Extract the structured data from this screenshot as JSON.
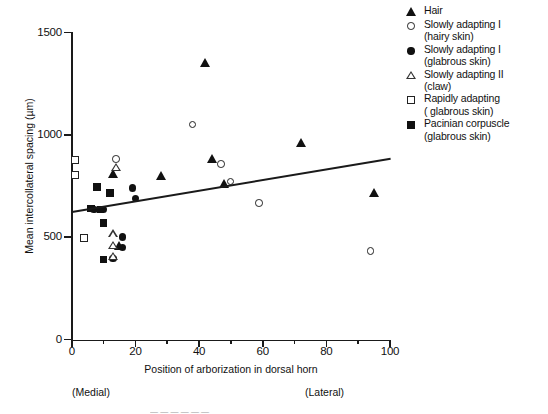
{
  "chart_data": {
    "type": "scatter",
    "title": "",
    "xlabel": "Position of arborization in dorsal horn",
    "ylabel": "Mean intercollateral spacing (µm)",
    "xlim": [
      0,
      100
    ],
    "ylim": [
      0,
      1500
    ],
    "xticks": [
      0,
      20,
      40,
      60,
      80,
      100
    ],
    "xticks_minor": [
      10,
      30,
      50,
      70,
      90
    ],
    "yticks": [
      0,
      500,
      1000,
      1500
    ],
    "grid": false,
    "legend_position": "top-right",
    "axis_annotations": {
      "left": "(Medial)",
      "right": "(Lateral)"
    },
    "trendline": {
      "x": [
        0,
        100
      ],
      "y": [
        630,
        890
      ]
    },
    "series": [
      {
        "name": "Hair",
        "marker": "triangle-filled",
        "points": [
          [
            13,
            810
          ],
          [
            28,
            800
          ],
          [
            42,
            1350
          ],
          [
            44,
            880
          ],
          [
            48,
            760
          ],
          [
            72,
            960
          ],
          [
            95,
            715
          ],
          [
            15,
            455
          ]
        ]
      },
      {
        "name": "Slowly adapting I (hairy skin)",
        "marker": "circle-open",
        "points": [
          [
            14,
            880
          ],
          [
            38,
            1050
          ],
          [
            47,
            855
          ],
          [
            50,
            770
          ],
          [
            59,
            665
          ],
          [
            94,
            430
          ]
        ]
      },
      {
        "name": "Slowly adapting I (glabrous skin)",
        "marker": "circle-filled",
        "points": [
          [
            19,
            740
          ],
          [
            20,
            690
          ],
          [
            7,
            635
          ],
          [
            10,
            635
          ],
          [
            16,
            500
          ],
          [
            16,
            450
          ],
          [
            13,
            395
          ]
        ]
      },
      {
        "name": "Slowly adapting II (claw)",
        "marker": "triangle-open",
        "points": [
          [
            14,
            840
          ],
          [
            13,
            530
          ],
          [
            13,
            490
          ],
          [
            13,
            450
          ]
        ]
      },
      {
        "name": "Rapidly adapting (glabrous skin)",
        "marker": "square-open",
        "points": [
          [
            1,
            875
          ],
          [
            1,
            800
          ],
          [
            4,
            495
          ]
        ]
      },
      {
        "name": "Pacinian corpuscle (glabrous skin)",
        "marker": "square-filled",
        "points": [
          [
            8,
            745
          ],
          [
            12,
            715
          ],
          [
            6,
            640
          ],
          [
            9,
            635
          ],
          [
            10,
            570
          ],
          [
            10,
            390
          ]
        ]
      }
    ]
  },
  "axis": {
    "y_title": "Mean intercollateral spacing (µm)",
    "x_title": "Position of arborization in dorsal horn",
    "y_ticks": [
      "0",
      "500",
      "1000",
      "1500"
    ],
    "x_ticks": [
      "0",
      "20",
      "40",
      "60",
      "80",
      "100"
    ],
    "medial": "(Medial)",
    "lateral": "(Lateral)"
  },
  "legend": {
    "items": [
      {
        "marker": "triangle-filled",
        "line1": "Hair",
        "line2": ""
      },
      {
        "marker": "circle-open",
        "line1": "Slowly adapting I",
        "line2": "(hairy skin)"
      },
      {
        "marker": "circle-filled",
        "line1": "Slowly adapting I",
        "line2": "(glabrous skin)"
      },
      {
        "marker": "triangle-open",
        "line1": "Slowly adapting II",
        "line2": "(claw)"
      },
      {
        "marker": "square-open",
        "line1": "Rapidly adapting",
        "line2": "( glabrous skin)"
      },
      {
        "marker": "square-filled",
        "line1": "Pacinian corpuscle",
        "line2": "(glabrous skin)"
      }
    ]
  },
  "caption": "—   —   —   —   —   —"
}
